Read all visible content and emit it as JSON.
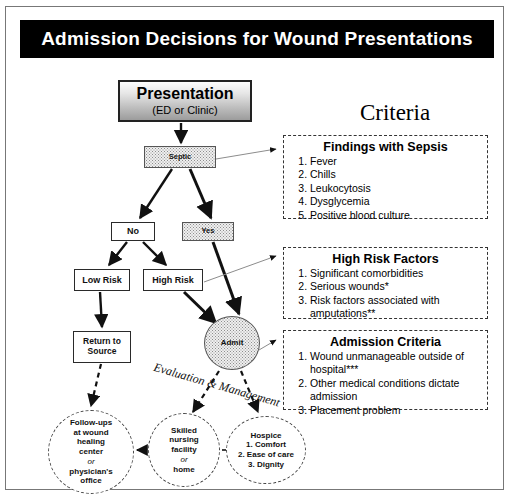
{
  "title": "Admission Decisions for Wound Presentations",
  "flow": {
    "presentation": {
      "line1": "Presentation",
      "line2": "(ED or Clinic)"
    },
    "septic": "Septic",
    "no": "No",
    "yes": "Yes",
    "low_risk": "Low Risk",
    "high_risk": "High Risk",
    "return_to_source": "Return to Source",
    "admit": "Admit",
    "eval_management": "Evaluation & Management"
  },
  "outcomes": {
    "followup": {
      "l1": "Follow-ups",
      "l2": "at wound",
      "l3": "healing",
      "l4": "center",
      "or": "or",
      "l5": "physician's",
      "l6": "office"
    },
    "snf": {
      "l1": "Skilled",
      "l2": "nursing",
      "l3": "facility",
      "or": "or",
      "l4": "home"
    },
    "hospice": {
      "title": "Hospice",
      "items": [
        "1. Comfort",
        "2. Ease of care",
        "3. Dignity"
      ]
    }
  },
  "criteria": {
    "heading": "Criteria",
    "sepsis": {
      "title": "Findings with Sepsis",
      "items": [
        "Fever",
        "Chills",
        "Leukocytosis",
        "Dysglycemia",
        "Positive blood culture"
      ]
    },
    "high_risk": {
      "title": "High Risk Factors",
      "items": [
        "Significant comorbidities",
        "Serious wounds*",
        "Risk factors associated with amputations**"
      ]
    },
    "admission": {
      "title": "Admission Criteria",
      "items": [
        "Wound unmanageable outside of hospital***",
        "Other medical conditions dictate admission",
        "Placement problem"
      ]
    }
  },
  "colors": {
    "title_bg": "#000000",
    "title_fg": "#ffffff",
    "border": "#2a2a2a",
    "page_bg": "#ffffff"
  }
}
